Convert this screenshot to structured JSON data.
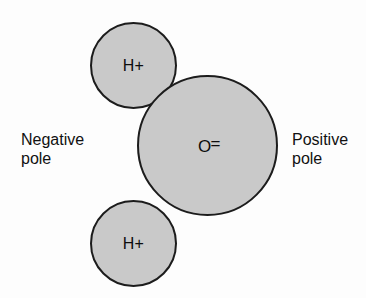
{
  "diagram": {
    "background_color": "#fdfdfd",
    "atom_fill_color": "#c9c9c9",
    "atom_outline_color": "#1c1c1c",
    "text_color": "#111111",
    "atoms": [
      {
        "id": "hydrogen-top",
        "label": "H+",
        "element": "H",
        "charge": "+",
        "center_x": 133,
        "center_y": 65,
        "radius": 43
      },
      {
        "id": "oxygen",
        "label": "O",
        "bond_symbol": "=",
        "element": "O",
        "center_x": 207,
        "center_y": 145,
        "radius": 70
      },
      {
        "id": "hydrogen-bottom",
        "label": "H+",
        "element": "H",
        "charge": "+",
        "center_x": 133,
        "center_y": 243,
        "radius": 43
      }
    ],
    "captions": {
      "negative_pole": "Negative\npole",
      "positive_pole": "Positive\npole"
    }
  }
}
